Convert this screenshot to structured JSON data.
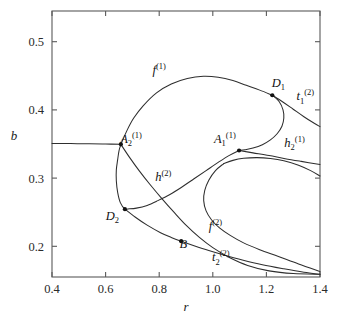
{
  "chart_data": {
    "type": "line",
    "title": "",
    "xlabel": "r",
    "ylabel": "b",
    "xlim": [
      0.4,
      1.4
    ],
    "ylim": [
      0.155,
      0.545
    ],
    "grid": false,
    "legend": "none",
    "xticks": [
      0.4,
      0.6,
      0.8,
      1.0,
      1.2,
      1.4
    ],
    "xtick_labels": [
      "0.4",
      "0.6",
      "0.8",
      "1.0",
      "1.2",
      "1.4"
    ],
    "yticks": [
      0.2,
      0.3,
      0.4,
      0.5
    ],
    "ytick_labels": [
      "0.2",
      "0.3",
      "0.4",
      "0.5"
    ],
    "annotations": [
      {
        "name": "f1",
        "text": "f(1)",
        "base": "f",
        "sup": "(1)",
        "sub": "",
        "x": 0.8,
        "y": 0.452
      },
      {
        "name": "D1",
        "text": "D1",
        "base": "D",
        "sup": "",
        "sub": "1",
        "x": 1.245,
        "y": 0.434
      },
      {
        "name": "t1_2",
        "text": "t1(2)",
        "base": "t",
        "sup": "(2)",
        "sub": "1",
        "x": 1.345,
        "y": 0.414
      },
      {
        "name": "A2_1",
        "text": "A2(1)",
        "base": "A",
        "sup": "(1)",
        "sub": "2",
        "x": 0.695,
        "y": 0.352
      },
      {
        "name": "A1_1",
        "text": "A1(1)",
        "base": "A",
        "sup": "(1)",
        "sub": "1",
        "x": 1.045,
        "y": 0.352
      },
      {
        "name": "h2_1",
        "text": "h2(1)",
        "base": "h",
        "sup": "(1)",
        "sub": "2",
        "x": 1.305,
        "y": 0.346
      },
      {
        "name": "h_2",
        "text": "h(2)",
        "base": "h",
        "sup": "(2)",
        "sub": "",
        "x": 0.815,
        "y": 0.296
      },
      {
        "name": "D2",
        "text": "D2",
        "base": "D",
        "sup": "",
        "sub": "2",
        "x": 0.625,
        "y": 0.239
      },
      {
        "name": "f2",
        "text": "f(2)",
        "base": "f",
        "sup": "(2)",
        "sub": "",
        "x": 1.01,
        "y": 0.224
      },
      {
        "name": "B",
        "text": "B",
        "base": "B",
        "sup": "",
        "sub": "",
        "x": 0.89,
        "y": 0.197
      },
      {
        "name": "t2_2",
        "text": "t2(2)",
        "base": "t",
        "sup": "(2)",
        "sub": "2",
        "x": 1.03,
        "y": 0.178
      }
    ],
    "points": [
      {
        "name": "A2_1",
        "x": 0.657,
        "y": 0.3495
      },
      {
        "name": "A1_1",
        "x": 1.098,
        "y": 0.3405
      },
      {
        "name": "D1",
        "x": 1.222,
        "y": 0.4215
      },
      {
        "name": "D2",
        "x": 0.672,
        "y": 0.2545
      },
      {
        "name": "B",
        "x": 0.882,
        "y": 0.2075
      }
    ],
    "series": [
      {
        "name": "h2-horizontal-branch",
        "comment": "flat line at b=0.35 from left edge to A2(1)",
        "points": [
          [
            0.4,
            0.3508
          ],
          [
            0.47,
            0.3506
          ],
          [
            0.54,
            0.3503
          ],
          [
            0.6,
            0.35
          ],
          [
            0.657,
            0.3495
          ]
        ]
      },
      {
        "name": "f1-loop-upper",
        "comment": "upper arc of big closed loop from A2(1) over top to D1",
        "points": [
          [
            0.657,
            0.3495
          ],
          [
            0.68,
            0.37
          ],
          [
            0.705,
            0.388
          ],
          [
            0.74,
            0.406
          ],
          [
            0.79,
            0.425
          ],
          [
            0.845,
            0.438
          ],
          [
            0.905,
            0.446
          ],
          [
            0.965,
            0.4492
          ],
          [
            1.02,
            0.4478
          ],
          [
            1.075,
            0.443
          ],
          [
            1.125,
            0.436
          ],
          [
            1.175,
            0.429
          ],
          [
            1.222,
            0.4215
          ]
        ]
      },
      {
        "name": "f1-loop-right",
        "comment": "from D1 turning down and back left to A1(1)",
        "points": [
          [
            1.222,
            0.4215
          ],
          [
            1.248,
            0.412
          ],
          [
            1.262,
            0.4
          ],
          [
            1.265,
            0.388
          ],
          [
            1.258,
            0.376
          ],
          [
            1.24,
            0.365
          ],
          [
            1.215,
            0.356
          ],
          [
            1.185,
            0.349
          ],
          [
            1.15,
            0.344
          ],
          [
            1.12,
            0.3415
          ],
          [
            1.098,
            0.3405
          ]
        ]
      },
      {
        "name": "f1-loop-lower",
        "comment": "from A1(1) down-left through cusp region to D2 then back up to A2(1)",
        "points": [
          [
            1.098,
            0.3405
          ],
          [
            1.06,
            0.333
          ],
          [
            1.02,
            0.323
          ],
          [
            0.975,
            0.311
          ],
          [
            0.93,
            0.299
          ],
          [
            0.885,
            0.287
          ],
          [
            0.84,
            0.276
          ],
          [
            0.795,
            0.267
          ],
          [
            0.755,
            0.26
          ],
          [
            0.715,
            0.256
          ],
          [
            0.683,
            0.2548
          ],
          [
            0.672,
            0.2545
          ],
          [
            0.655,
            0.264
          ],
          [
            0.645,
            0.279
          ],
          [
            0.64,
            0.296
          ],
          [
            0.64,
            0.312
          ],
          [
            0.645,
            0.327
          ],
          [
            0.65,
            0.34
          ],
          [
            0.657,
            0.3495
          ]
        ]
      },
      {
        "name": "t1-2-branch",
        "comment": "continues from D1 down-right to right edge",
        "points": [
          [
            1.222,
            0.4215
          ],
          [
            1.26,
            0.412
          ],
          [
            1.3,
            0.401
          ],
          [
            1.34,
            0.39
          ],
          [
            1.38,
            0.38
          ],
          [
            1.4,
            0.3755
          ]
        ]
      },
      {
        "name": "h2-1-branch",
        "comment": "from A1(1) rightward slightly down to right edge",
        "points": [
          [
            1.098,
            0.3405
          ],
          [
            1.15,
            0.337
          ],
          [
            1.21,
            0.333
          ],
          [
            1.27,
            0.3285
          ],
          [
            1.33,
            0.3245
          ],
          [
            1.4,
            0.32
          ]
        ]
      },
      {
        "name": "f2-upper-branch",
        "comment": "arc from cusp near A1(1) area going right and down to right edge",
        "points": [
          [
            1.04,
            0.321
          ],
          [
            1.075,
            0.326
          ],
          [
            1.115,
            0.329
          ],
          [
            1.165,
            0.33
          ],
          [
            1.215,
            0.3288
          ],
          [
            1.265,
            0.3255
          ],
          [
            1.32,
            0.319
          ],
          [
            1.365,
            0.311
          ],
          [
            1.4,
            0.303
          ]
        ]
      },
      {
        "name": "f2-loop-left",
        "comment": "f(2) loop descending from cusp down-left then sweeping right to bottom-right",
        "points": [
          [
            1.04,
            0.321
          ],
          [
            1.01,
            0.311
          ],
          [
            0.985,
            0.297
          ],
          [
            0.97,
            0.282
          ],
          [
            0.966,
            0.267
          ],
          [
            0.975,
            0.252
          ],
          [
            0.995,
            0.239
          ],
          [
            1.025,
            0.227
          ],
          [
            1.065,
            0.216
          ],
          [
            1.115,
            0.205
          ],
          [
            1.175,
            0.195
          ],
          [
            1.245,
            0.185
          ],
          [
            1.32,
            0.174
          ],
          [
            1.4,
            0.163
          ]
        ]
      },
      {
        "name": "h-2-branch",
        "comment": "from A2(1) descending right through B region to bottom-right",
        "points": [
          [
            0.657,
            0.3495
          ],
          [
            0.69,
            0.33
          ],
          [
            0.725,
            0.311
          ],
          [
            0.765,
            0.291
          ],
          [
            0.81,
            0.27
          ],
          [
            0.855,
            0.25
          ],
          [
            0.9,
            0.231
          ],
          [
            0.95,
            0.213
          ],
          [
            1.0,
            0.198
          ],
          [
            1.06,
            0.184
          ],
          [
            1.13,
            0.172
          ],
          [
            1.21,
            0.164
          ],
          [
            1.3,
            0.16
          ],
          [
            1.4,
            0.159
          ]
        ]
      },
      {
        "name": "t2-2-branch",
        "comment": "from D2 through B continuing down-right to bottom-right corner",
        "points": [
          [
            0.672,
            0.2545
          ],
          [
            0.71,
            0.243
          ],
          [
            0.755,
            0.231
          ],
          [
            0.805,
            0.22
          ],
          [
            0.845,
            0.213
          ],
          [
            0.882,
            0.2075
          ],
          [
            0.93,
            0.201
          ],
          [
            0.985,
            0.194
          ],
          [
            1.045,
            0.187
          ],
          [
            1.11,
            0.18
          ],
          [
            1.185,
            0.173
          ],
          [
            1.265,
            0.167
          ],
          [
            1.34,
            0.162
          ],
          [
            1.4,
            0.159
          ]
        ]
      }
    ]
  }
}
